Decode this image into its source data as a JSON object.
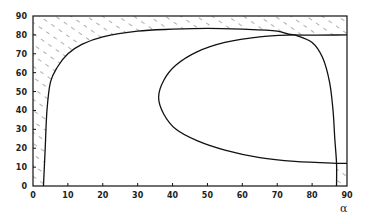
{
  "chart_data": {
    "type": "line",
    "title": "",
    "xlabel": "α",
    "ylabel": "",
    "xlim": [
      0,
      90
    ],
    "ylim": [
      0,
      90
    ],
    "x_ticks": [
      0,
      10,
      20,
      30,
      40,
      50,
      60,
      70,
      80,
      90
    ],
    "y_ticks": [
      0,
      10,
      20,
      30,
      40,
      50,
      60,
      70,
      80,
      90
    ],
    "grid": false,
    "legend": null,
    "series": [
      {
        "name": "left-boundary-curve",
        "points": [
          [
            3,
            0
          ],
          [
            3.5,
            20
          ],
          [
            4,
            40
          ],
          [
            5,
            55
          ],
          [
            7,
            63
          ],
          [
            10,
            70
          ],
          [
            14,
            75
          ],
          [
            20,
            79
          ],
          [
            30,
            82
          ],
          [
            40,
            83
          ],
          [
            50,
            83.5
          ],
          [
            60,
            83
          ],
          [
            70,
            82
          ],
          [
            75,
            80
          ],
          [
            90,
            80
          ]
        ]
      },
      {
        "name": "loop-curve",
        "points": [
          [
            75,
            80
          ],
          [
            65,
            79
          ],
          [
            55,
            76
          ],
          [
            47,
            71
          ],
          [
            41,
            64
          ],
          [
            37.5,
            56
          ],
          [
            36,
            47
          ],
          [
            37.5,
            38
          ],
          [
            41,
            30
          ],
          [
            47,
            24
          ],
          [
            55,
            19
          ],
          [
            65,
            15
          ],
          [
            75,
            13
          ],
          [
            87,
            12
          ],
          [
            90,
            12
          ]
        ]
      },
      {
        "name": "right-boundary-curve",
        "points": [
          [
            75,
            80
          ],
          [
            80,
            76
          ],
          [
            83,
            68
          ],
          [
            85,
            55
          ],
          [
            86,
            40
          ],
          [
            86.5,
            25
          ],
          [
            87,
            12
          ],
          [
            87,
            0
          ]
        ]
      }
    ],
    "shaded_regions": [
      {
        "name": "left-top-infeasible",
        "description": "hatched region left of and above the left boundary curve, up to y=90"
      },
      {
        "name": "bottom-right-infeasible",
        "description": "hatched box from α≈87 to 90, y from 0 to ≈12"
      }
    ]
  },
  "axes": {
    "x_tick_labels": [
      "0",
      "10",
      "20",
      "30",
      "40",
      "50",
      "60",
      "70",
      "80",
      "90"
    ],
    "y_tick_labels": [
      "0",
      "10",
      "20",
      "30",
      "40",
      "50",
      "60",
      "70",
      "80",
      "90"
    ],
    "x_axis_label": "α"
  }
}
